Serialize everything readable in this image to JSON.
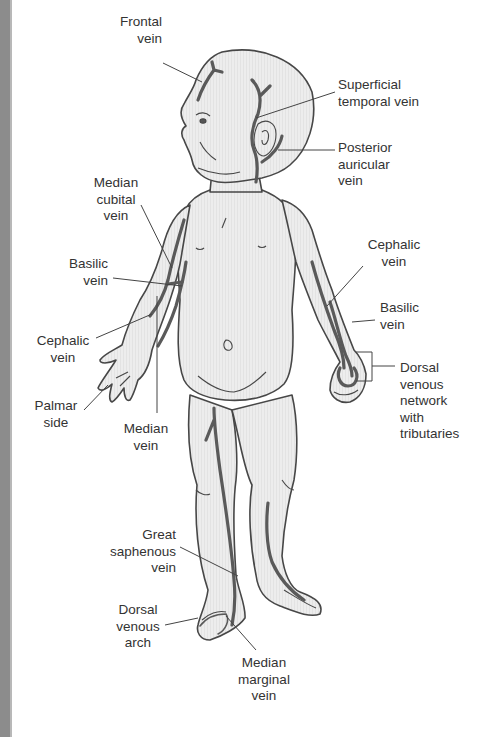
{
  "diagram": {
    "colors": {
      "background": "#ffffff",
      "body_fill": "#ececec",
      "body_outline": "#474747",
      "vein": "#5a5a5a",
      "leader_line": "#444444",
      "label_text": "#333333",
      "edge_stripe": "#8c8c8c"
    },
    "labels": {
      "frontal_vein": "Frontal\nvein",
      "superficial_temporal_vein": "Superficial\ntemporal vein",
      "posterior_auricular_vein": "Posterior\nauricular\nvein",
      "median_cubital_vein": "Median\ncubital\nvein",
      "basilic_vein_left": "Basilic\nvein",
      "cephalic_vein_left": "Cephalic\nvein",
      "palmar_side": "Palmar\nside",
      "median_vein": "Median\nvein",
      "cephalic_vein_right": "Cephalic\nvein",
      "basilic_vein_right": "Basilic\nvein",
      "dorsal_venous_network": "Dorsal\nvenous\nnetwork\nwith\ntributaries",
      "great_saphenous_vein": "Great\nsaphenous\nvein",
      "dorsal_venous_arch": "Dorsal\nvenous\narch",
      "median_marginal_vein": "Median\nmarginal\nvein"
    }
  }
}
